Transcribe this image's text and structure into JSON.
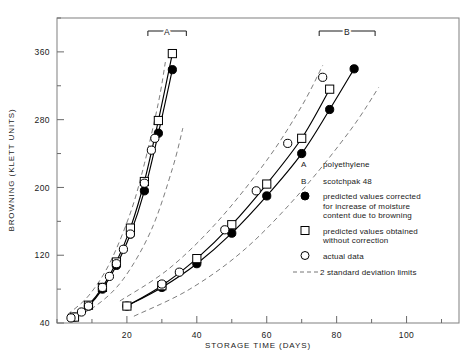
{
  "chart_data": {
    "type": "line",
    "title": "",
    "xlabel": "STORAGE TIME (DAYS)",
    "ylabel": "BROWNING (KLETT UNITS)",
    "xlim": [
      0,
      115
    ],
    "ylim": [
      40,
      400
    ],
    "xticks": [
      20,
      40,
      60,
      80,
      100
    ],
    "yticks": [
      40,
      120,
      200,
      280,
      360
    ],
    "x_minor_step": 10,
    "y_minor_step": 40,
    "grid": false,
    "legend_position": "right-middle",
    "groups": [
      {
        "key": "A",
        "label": "A",
        "name": "polyethylene",
        "bracket_x": [
          26,
          37
        ],
        "series": [
          {
            "name": "predicted values corrected for increase of moisture content due to browning",
            "marker": "filled-circle",
            "x": [
              5,
              9,
              13,
              17,
              21,
              25,
              29,
              33
            ],
            "y": [
              47,
              60,
              80,
              108,
              145,
              196,
              264,
              339
            ]
          },
          {
            "name": "predicted values obtained without correction",
            "marker": "open-square",
            "x": [
              5,
              9,
              13,
              17,
              21,
              25,
              29,
              33
            ],
            "y": [
              47,
              61,
              82,
              112,
              152,
              207,
              279,
              358
            ]
          },
          {
            "name": "actual data",
            "marker": "open-circle",
            "x": [
              4,
              7,
              9,
              13,
              15,
              17,
              19,
              21,
              25,
              27,
              28
            ],
            "y": [
              46,
              53,
              60,
              82,
              95,
              110,
              127,
              145,
              205,
              244,
              258
            ]
          }
        ],
        "bands": [
          {
            "name": "upper 2sd",
            "x": [
              3,
              9,
              15,
              21,
              25,
              29,
              31
            ],
            "y": [
              50,
              72,
              110,
              170,
              228,
              300,
              348
            ]
          },
          {
            "name": "lower 2sd",
            "x": [
              3,
              11,
              19,
              27,
              33,
              36
            ],
            "y": [
              44,
              60,
              92,
              150,
              222,
              270
            ]
          }
        ]
      },
      {
        "key": "B",
        "label": "B",
        "name": "scotchpak 48",
        "bracket_x": [
          75,
          91
        ],
        "series": [
          {
            "name": "predicted values corrected for increase of moisture content due to browning",
            "marker": "filled-circle",
            "x": [
              20,
              30,
              40,
              50,
              60,
              70,
              78,
              85
            ],
            "y": [
              60,
              82,
              110,
              146,
              190,
              240,
              292,
              340
            ]
          },
          {
            "name": "predicted values obtained without correction",
            "marker": "open-square",
            "x": [
              20,
              30,
              40,
              50,
              60,
              70,
              78
            ],
            "y": [
              60,
              84,
              116,
              156,
              204,
              258,
              316
            ]
          },
          {
            "name": "actual data",
            "marker": "open-circle",
            "x": [
              30,
              35,
              48,
              57,
              66,
              76
            ],
            "y": [
              86,
              100,
              150,
              196,
              252,
              330
            ]
          }
        ],
        "bands": [
          {
            "name": "upper 2sd",
            "x": [
              18,
              32,
              46,
              60,
              70,
              76
            ],
            "y": [
              66,
              104,
              160,
              232,
              296,
              344
            ]
          },
          {
            "name": "lower 2sd",
            "x": [
              22,
              38,
              54,
              70,
              84,
              92
            ],
            "y": [
              48,
              80,
              128,
              196,
              268,
              318
            ]
          }
        ]
      }
    ],
    "legend": [
      {
        "marker": "text-A",
        "symbol": "A",
        "text": "polyethylene"
      },
      {
        "marker": "text-B",
        "symbol": "B",
        "text": "scotchpak 48"
      },
      {
        "marker": "filled-circle",
        "symbol": "",
        "text": "predicted values corrected\nfor increase of moisture\ncontent due to browning"
      },
      {
        "marker": "open-square",
        "symbol": "",
        "text": "predicted values obtained\nwithout correction"
      },
      {
        "marker": "open-circle",
        "symbol": "",
        "text": "actual data"
      },
      {
        "marker": "dashed-line",
        "symbol": "",
        "text": "2 standard deviation limits"
      }
    ],
    "colors": {
      "line": "#000000",
      "band": "#666666",
      "frame": "#808080",
      "text": "#1a1a1a"
    }
  }
}
